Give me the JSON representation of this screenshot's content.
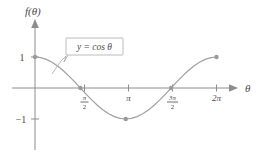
{
  "chart_data": {
    "type": "line",
    "title": "",
    "xlabel": "θ",
    "ylabel": "f(θ)",
    "xlim": [
      0,
      7.3304
    ],
    "ylim": [
      -1.45,
      1.45
    ],
    "grid": false,
    "legend_position": "inline-callout",
    "annotations": [
      {
        "name": "curve-equation-callout",
        "text": "y = cos θ",
        "points_to_x": 1.0,
        "points_to_y": 0.54
      }
    ],
    "series": [
      {
        "name": "y = cos θ",
        "color": "#a0a0a0",
        "x": [
          0.0,
          0.1963,
          0.3927,
          0.589,
          0.7854,
          0.9817,
          1.1781,
          1.3744,
          1.5708,
          1.7671,
          1.9635,
          2.1598,
          2.3562,
          2.5525,
          2.7489,
          2.9452,
          3.1416,
          3.3379,
          3.5343,
          3.7306,
          3.927,
          4.1233,
          4.3197,
          4.516,
          4.7124,
          4.9087,
          5.1051,
          5.3014,
          5.4978,
          5.6941,
          5.8905,
          6.0868,
          6.2832
        ],
        "y": [
          1.0,
          0.9808,
          0.9239,
          0.8315,
          0.7071,
          0.5556,
          0.3827,
          0.1951,
          0.0,
          -0.1951,
          -0.3827,
          -0.5556,
          -0.7071,
          -0.8315,
          -0.9239,
          -0.9808,
          -1.0,
          -0.9808,
          -0.9239,
          -0.8315,
          -0.7071,
          -0.5556,
          -0.3827,
          -0.1951,
          0.0,
          0.1951,
          0.3827,
          0.5556,
          0.7071,
          0.8315,
          0.9239,
          0.9808,
          1.0
        ]
      }
    ],
    "markers": [
      {
        "name": "point-0-1",
        "x": 0.0,
        "y": 1.0,
        "label": "(0, 1)"
      },
      {
        "name": "point-halfpi-0",
        "x": 1.5708,
        "y": 0.0,
        "label": "(π/2, 0)"
      },
      {
        "name": "point-pi-neg1",
        "x": 3.1416,
        "y": -1.0,
        "label": "(π, -1)"
      },
      {
        "name": "point-3halfpi-0",
        "x": 4.7124,
        "y": 0.0,
        "label": "(3π/2, 0)"
      },
      {
        "name": "point-2pi-1",
        "x": 6.2832,
        "y": 1.0,
        "label": "(2π, 1)"
      }
    ],
    "x_ticks": [
      {
        "value": 1.5708,
        "label": "π/2",
        "numerator": "π",
        "denominator": "2",
        "is_fraction": true
      },
      {
        "value": 3.1416,
        "label": "π",
        "numerator": "",
        "denominator": "",
        "is_fraction": false
      },
      {
        "value": 4.7124,
        "label": "3π/2",
        "numerator": "3π",
        "denominator": "2",
        "is_fraction": true
      },
      {
        "value": 6.2832,
        "label": "2π",
        "numerator": "",
        "denominator": "",
        "is_fraction": false
      }
    ],
    "y_ticks": [
      {
        "value": 1.0,
        "label": "1"
      },
      {
        "value": -1.0,
        "label": "−1"
      }
    ]
  },
  "axes": {
    "y_axis_label": "f(θ)",
    "x_axis_label": "θ"
  },
  "colors": {
    "curve": "#a0a0a0",
    "axis": "#8c8c8c",
    "text": "#4a4a4a",
    "marker": "#9a9a9a",
    "callout_border": "#b4b4b4",
    "background": "#ffffff"
  }
}
